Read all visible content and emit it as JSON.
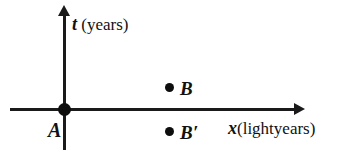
{
  "figure": {
    "background_color": "#ffffff",
    "ink_color": "#111111"
  },
  "axes": {
    "vertical": {
      "variable": "t",
      "unit": "(years)",
      "direction": "up"
    },
    "horizontal": {
      "variable": "x",
      "unit": "(lightyears)",
      "direction": "right"
    }
  },
  "points": [
    {
      "id": "origin",
      "label": "A",
      "x_px": 65,
      "y_px": 110
    },
    {
      "id": "event-b",
      "label": "B",
      "x_px": 170,
      "y_px": 88
    },
    {
      "id": "event-b-prime",
      "label": "B′",
      "x_px": 170,
      "y_px": 132
    }
  ],
  "chart_data": {
    "type": "scatter",
    "title": "",
    "xlabel": "x (lightyears)",
    "ylabel": "t (years)",
    "grid": false,
    "legend": "none",
    "point_labels": [
      "A",
      "B",
      "B′"
    ],
    "x": [
      0,
      1.1,
      1.1
    ],
    "y": [
      0,
      0.25,
      -0.25
    ],
    "annotations": [
      "A at origin",
      "B above x-axis",
      "B′ below x-axis"
    ]
  }
}
